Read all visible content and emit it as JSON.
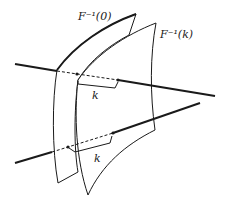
{
  "diagram": {
    "labels": {
      "surface_zero": "F⁻¹(0)",
      "surface_k": "F⁻¹(k)",
      "offset_upper": "k",
      "offset_lower": "k"
    },
    "elements": {
      "surfaces": [
        "F⁻¹(0)",
        "F⁻¹(k)"
      ],
      "lines": 2,
      "offset_brackets": 2
    },
    "colors": {
      "stroke": "#1a1a1a",
      "background": "#ffffff"
    }
  }
}
